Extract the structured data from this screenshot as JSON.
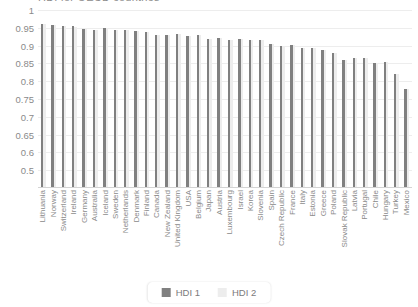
{
  "chart_data": {
    "type": "bar",
    "title": "HDI for OECD countries",
    "xlabel": "",
    "ylabel": "",
    "ylim": [
      0.5,
      1.0
    ],
    "yticks": [
      "1",
      "0.95",
      "0.9",
      "0.85",
      "0.8",
      "0.75",
      "0.7",
      "0.65",
      "0.6",
      "0.5"
    ],
    "ytick_values": [
      1,
      0.95,
      0.9,
      0.85,
      0.8,
      0.75,
      0.7,
      0.65,
      0.6,
      0.55
    ],
    "grid": true,
    "legend_position": "bottom-center",
    "categories": [
      "Lithuania",
      "Norway",
      "Switzerland",
      "Ireland",
      "Germany",
      "Australia",
      "Iceland",
      "Sweden",
      "Netherlands",
      "Denmark",
      "Finland",
      "Canada",
      "New Zealand",
      "United Kingdom",
      "USA",
      "Belgium",
      "Japan",
      "Austria",
      "Luxembourg",
      "Israel",
      "Korea",
      "Slovenia",
      "Spain",
      "Czech Republic",
      "France",
      "Italy",
      "Estonia",
      "Greece",
      "Poland",
      "Slovak Republic",
      "Latvia",
      "Portugal",
      "Chile",
      "Hungary",
      "Turkey",
      "Mexico"
    ],
    "series": [
      {
        "name": "HDI 1",
        "color": "#808080",
        "values": [
          0.962,
          0.957,
          0.955,
          0.955,
          0.947,
          0.944,
          0.949,
          0.945,
          0.944,
          0.94,
          0.938,
          0.929,
          0.931,
          0.932,
          0.926,
          0.931,
          0.919,
          0.922,
          0.916,
          0.919,
          0.916,
          0.917,
          0.904,
          0.9,
          0.901,
          0.892,
          0.892,
          0.888,
          0.88,
          0.86,
          0.866,
          0.864,
          0.851,
          0.854,
          0.82,
          0.779
        ]
      },
      {
        "name": "HDI 2",
        "color": "#ededed",
        "values": [
          0.96,
          0.957,
          0.955,
          0.953,
          0.947,
          0.944,
          0.949,
          0.945,
          0.944,
          0.94,
          0.938,
          0.929,
          0.931,
          0.932,
          0.926,
          0.931,
          0.919,
          0.922,
          0.916,
          0.919,
          0.916,
          0.917,
          0.904,
          0.9,
          0.901,
          0.892,
          0.892,
          0.888,
          0.88,
          0.86,
          0.866,
          0.864,
          0.851,
          0.854,
          0.82,
          0.779
        ]
      }
    ]
  },
  "legend": {
    "items": [
      {
        "label": "HDI 1"
      },
      {
        "label": "HDI 2"
      }
    ]
  }
}
